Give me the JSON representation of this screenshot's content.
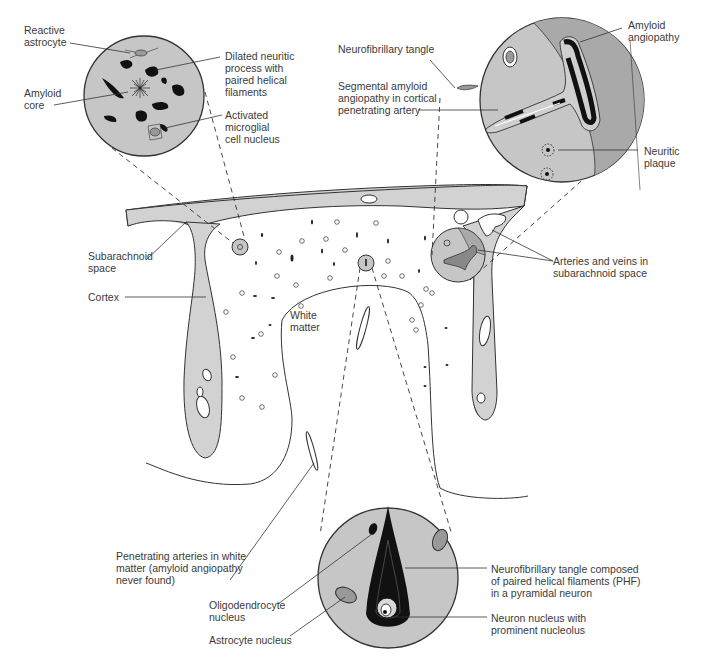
{
  "figure": {
    "colors": {
      "tissue_gray": "#d2d2d2",
      "circle_gray": "#c6c6c6",
      "dark_region": "#a9a9a9",
      "outline": "#333333",
      "text": "#3a3a3a",
      "background": "#ffffff"
    }
  },
  "labels": {
    "reactive_astrocyte": "Reactive\nastrocyte",
    "dilated_neuritic": "Dilated neuritic\nprocess with\npaired helical\nfilaments",
    "amyloid_core": "Amyloid\ncore",
    "activated_microglial": "Activated\nmicroglial\ncell nucleus",
    "neurofibrillary_tangle_top": "Neurofibrillary tangle",
    "segmental_amyloid": "Segmental amyloid\nangiopathy in cortical\npenetrating artery",
    "amyloid_angiopathy": "Amyloid\nangiopathy",
    "neuritic_plaque": "Neuritic\nplaque",
    "subarachnoid_space": "Subarachnoid\nspace",
    "cortex": "Cortex",
    "white_matter": "White\nmatter",
    "arteries_veins": "Arteries and veins in\nsubarachnoid space",
    "penetrating_arteries": "Penetrating arteries in white\nmatter (amyloid angiopathy\nnever found)",
    "oligodendrocyte": "Oligodendrocyte\nnucleus",
    "astrocyte_nucleus": "Astrocyte nucleus",
    "nft_composed": "Neurofibrillary tangle composed\nof paired helical filaments (PHF)\nin a pyramidal neuron",
    "neuron_nucleus": "Neuron nucleus with\nprominent nucleolus"
  }
}
